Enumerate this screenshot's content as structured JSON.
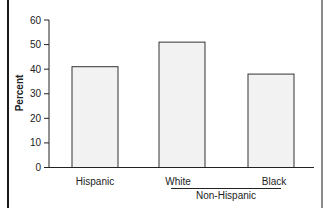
{
  "chart_data": {
    "type": "bar",
    "title": "",
    "xlabel": "",
    "ylabel": "Percent",
    "ylim": [
      0,
      60
    ],
    "yticks": [
      0,
      10,
      20,
      30,
      40,
      50,
      60
    ],
    "categories": [
      "Hispanic",
      "White",
      "Black"
    ],
    "values": [
      41,
      51,
      38
    ],
    "category_group": {
      "label": "Non-Hispanic",
      "members": [
        "White",
        "Black"
      ]
    },
    "grid": false,
    "legend": null,
    "bar_fill": "#f2f2f2",
    "bar_stroke": "#333333"
  }
}
